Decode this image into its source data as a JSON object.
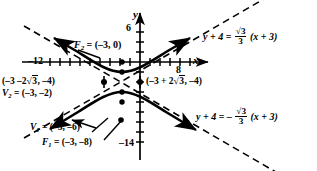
{
  "figure": {
    "type": "hyperbola-graph",
    "axes": {
      "x_label": "x",
      "y_label": "y",
      "x_ticks_labeled": [
        "-12",
        "8"
      ],
      "y_ticks_labeled": [
        "6",
        "-14"
      ],
      "x_range": [
        -16,
        12
      ],
      "y_range": [
        -16,
        8
      ],
      "tick_step": 2,
      "grid": false
    },
    "points": [
      {
        "id": "F2",
        "label": "F",
        "sub": "2",
        "text": "F₂ = (−3, 0)",
        "value": "(-3, 0)"
      },
      {
        "id": "V2",
        "label": "V",
        "sub": "2",
        "text": "V₂ = (−3, −2)",
        "value": "(-3, -2)"
      },
      {
        "id": "V1",
        "label": "V",
        "sub": "1",
        "text": "V₁ = (−3, −6)",
        "value": "(-3, -6)"
      },
      {
        "id": "F1",
        "label": "F",
        "sub": "1",
        "text": "F₁ = (−3, −8)",
        "value": "(-3, -8)"
      },
      {
        "id": "PL",
        "label": "",
        "sub": "",
        "text": "(−3 −2 √3, −4)",
        "value": "(-3-2sqrt3, -4)"
      },
      {
        "id": "PR",
        "label": "",
        "sub": "",
        "text": "(−3 + 2 √3, −4)",
        "value": "(-3+2sqrt3, -4)"
      }
    ],
    "labels": {
      "f2": {
        "name": "F",
        "sub": "2",
        "eq": "=",
        "coords": "(–3, 0)"
      },
      "v2": {
        "name": "V",
        "sub": "2",
        "eq": "=",
        "coords": "(–3, –2)"
      },
      "v1": {
        "name": "V",
        "sub": "1",
        "eq": "=",
        "coords": "(–3, –6)"
      },
      "f1": {
        "name": "F",
        "sub": "1",
        "eq": "=",
        "coords": "(–3, –8)"
      },
      "point_left": {
        "open": "(–3 –2",
        "radical": "3",
        "close": ", –4)"
      },
      "point_right": {
        "open": "(–3 + 2",
        "radical": "3",
        "close": ", –4)"
      },
      "tick_neg12": "–12",
      "tick_8": "8",
      "tick_6": "6",
      "tick_neg14": "–14",
      "axis_x": "x",
      "axis_y": "y"
    },
    "asymptotes": [
      {
        "id": "asym-positive",
        "lhs": "y + 4",
        "eq": "=",
        "sign": "",
        "num": "√3",
        "den": "3",
        "rhs": "(x + 3)",
        "slope": 0.5773502692,
        "full": "y + 4 = (√3/3)(x + 3)"
      },
      {
        "id": "asym-negative",
        "lhs": "y + 4",
        "eq": "=",
        "sign": "–",
        "num": "√3",
        "den": "3",
        "rhs": "(x + 3)",
        "slope": -0.5773502692,
        "full": "y + 4 = –(√3/3)(x + 3)"
      }
    ],
    "colors": {
      "ink": "#000000",
      "paper": "#ffffff"
    }
  }
}
